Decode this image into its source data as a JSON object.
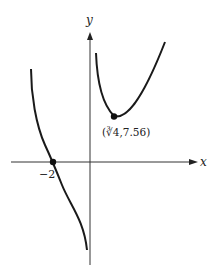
{
  "figure": {
    "type": "function-graph",
    "axes": {
      "x_label": "x",
      "y_label": "y"
    },
    "annotations": {
      "x_intercept_label": "−2",
      "local_min_label": "(∛4, 7.56)",
      "local_min_label_display": "(∛4,7.56)"
    },
    "points": [
      {
        "name": "x-intercept",
        "x": -2,
        "y": 0
      },
      {
        "name": "local-minimum",
        "x": "∛4",
        "y": 7.56
      }
    ],
    "colors": {
      "curve": "#1a1a1a",
      "axis": "#333333",
      "background": "#ffffff"
    }
  }
}
